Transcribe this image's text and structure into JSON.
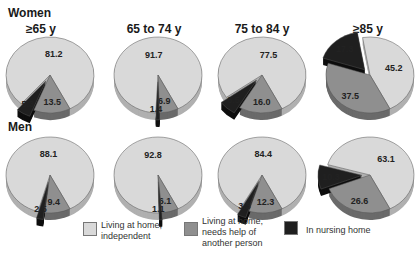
{
  "chart_data": {
    "type": "pie",
    "title": "",
    "row_labels": [
      "Women",
      "Men"
    ],
    "column_labels": [
      "≥65 y",
      "65 to 74 y",
      "75 to 84 y",
      "≥85 y"
    ],
    "legend": [
      {
        "label": "Living at home, independent",
        "color": "#d9d9d9"
      },
      {
        "label": "Living at home, needs help of another person",
        "color": "#8f8f8f"
      },
      {
        "label": "In nursing home",
        "color": "#1f1f1f"
      }
    ],
    "series": [
      {
        "group": "Women",
        "age": "≥65 y",
        "values": [
          81.2,
          13.5,
          5.3
        ]
      },
      {
        "group": "Women",
        "age": "65 to 74 y",
        "values": [
          91.7,
          6.9,
          1.4
        ]
      },
      {
        "group": "Women",
        "age": "75 to 84 y",
        "values": [
          77.5,
          16.0,
          6.5
        ]
      },
      {
        "group": "Women",
        "age": "≥85 y",
        "values": [
          45.2,
          37.5,
          17.3
        ]
      },
      {
        "group": "Men",
        "age": "≥65 y",
        "values": [
          88.1,
          9.4,
          2.5
        ]
      },
      {
        "group": "Men",
        "age": "65 to 74 y",
        "values": [
          92.8,
          6.1,
          1.1
        ]
      },
      {
        "group": "Men",
        "age": "75 to 84 y",
        "values": [
          84.4,
          12.3,
          3.3
        ]
      },
      {
        "group": "Men",
        "age": "≥85 y",
        "values": [
          63.1,
          26.6,
          10.3
        ]
      }
    ],
    "labels": {
      "women": [
        [
          "81.2",
          "13.5",
          "5.3"
        ],
        [
          "91.7",
          "6.9",
          "1.4"
        ],
        [
          "77.5",
          "16.0",
          "6.5"
        ],
        [
          "45.2",
          "37.5",
          "17.3"
        ]
      ],
      "men": [
        [
          "88.1",
          "9.4",
          "2.5"
        ],
        [
          "92.8",
          "6.1",
          "1.1"
        ],
        [
          "84.4",
          "12.3",
          "3.3"
        ],
        [
          "63.1",
          "26.6",
          "10.3"
        ]
      ]
    }
  },
  "rows": {
    "women": "Women",
    "men": "Men"
  },
  "columns": [
    "≥65 y",
    "65 to 74 y",
    "75 to 84 y",
    "≥85 y"
  ],
  "legend": {
    "independent_l1": "Living at home,",
    "independent_l2": "independent",
    "help_l1": "Living at home,",
    "help_l2": "needs help of",
    "help_l3": "another person",
    "nursing": "In nursing home"
  }
}
